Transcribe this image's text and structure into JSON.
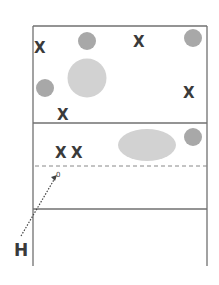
{
  "diagram": {
    "frame": {
      "x": 33,
      "y": 26,
      "width": 174,
      "height": 240
    },
    "lines": [
      {
        "type": "solid",
        "y": 123
      },
      {
        "type": "dashed",
        "y": 166
      },
      {
        "type": "solid",
        "y": 209
      }
    ],
    "colors": {
      "border": "#707070",
      "small_circle": "#a8a8a8",
      "large_shape": "#d2d2d2",
      "marker": "#3a3a3a"
    },
    "x_markers": [
      {
        "label": "X",
        "x": 40,
        "y": 47
      },
      {
        "label": "X",
        "x": 138,
        "y": 41
      },
      {
        "label": "X",
        "x": 188,
        "y": 93
      },
      {
        "label": "X",
        "x": 63,
        "y": 115
      },
      {
        "label": "X",
        "x": 61,
        "y": 153
      },
      {
        "label": "X",
        "x": 77,
        "y": 153
      }
    ],
    "small_circles": [
      {
        "cx": 87,
        "cy": 41,
        "r": 9
      },
      {
        "cx": 193,
        "cy": 38,
        "r": 9
      },
      {
        "cx": 45,
        "cy": 88,
        "r": 9
      },
      {
        "cx": 193,
        "cy": 137,
        "r": 9
      }
    ],
    "large_circle": {
      "cx": 87,
      "cy": 78,
      "r": 19
    },
    "ellipse": {
      "cx": 147,
      "cy": 145,
      "rx": 29,
      "ry": 16
    },
    "arrow": {
      "from": [
        21,
        236
      ],
      "to": [
        56,
        177
      ],
      "label": "0"
    },
    "point_label": "H"
  }
}
